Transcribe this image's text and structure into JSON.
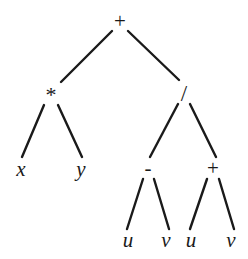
{
  "figure": {
    "type": "expression-tree",
    "background_color": "#ffffff",
    "stroke_color": "#1a1a1a",
    "text_color": "#1a1a1a",
    "width": 248,
    "height": 259
  },
  "nodes": {
    "root": {
      "label": "+",
      "x": 120,
      "y": 21,
      "kind": "operator"
    },
    "mul": {
      "label": "*",
      "x": 51,
      "y": 95,
      "kind": "operator"
    },
    "div": {
      "label": "/",
      "x": 184,
      "y": 93,
      "kind": "operator"
    },
    "x": {
      "label": "x",
      "x": 21,
      "y": 169,
      "kind": "variable"
    },
    "y": {
      "label": "y",
      "x": 81,
      "y": 169,
      "kind": "variable"
    },
    "sub": {
      "label": "-",
      "x": 148,
      "y": 168,
      "kind": "operator"
    },
    "add2": {
      "label": "+",
      "x": 213,
      "y": 168,
      "kind": "operator"
    },
    "u1": {
      "label": "u",
      "x": 128,
      "y": 240,
      "kind": "variable"
    },
    "v1": {
      "label": "v",
      "x": 166,
      "y": 240,
      "kind": "variable"
    },
    "u2": {
      "label": "u",
      "x": 191,
      "y": 240,
      "kind": "variable"
    },
    "v2": {
      "label": "v",
      "x": 231,
      "y": 240,
      "kind": "variable"
    }
  },
  "edges": [
    {
      "from": "root",
      "to": "mul",
      "x1": 112,
      "y1": 31,
      "x2": 61,
      "y2": 82
    },
    {
      "from": "root",
      "to": "div",
      "x1": 128,
      "y1": 31,
      "x2": 179,
      "y2": 80
    },
    {
      "from": "mul",
      "to": "x",
      "x1": 44,
      "y1": 105,
      "x2": 22,
      "y2": 157
    },
    {
      "from": "mul",
      "to": "y",
      "x1": 58,
      "y1": 105,
      "x2": 82,
      "y2": 157
    },
    {
      "from": "div",
      "to": "sub",
      "x1": 178,
      "y1": 104,
      "x2": 150,
      "y2": 157
    },
    {
      "from": "div",
      "to": "add2",
      "x1": 190,
      "y1": 104,
      "x2": 216,
      "y2": 157
    },
    {
      "from": "sub",
      "to": "u1",
      "x1": 143,
      "y1": 179,
      "x2": 127,
      "y2": 229
    },
    {
      "from": "sub",
      "to": "v1",
      "x1": 154,
      "y1": 179,
      "x2": 169,
      "y2": 229
    },
    {
      "from": "add2",
      "to": "u2",
      "x1": 207,
      "y1": 179,
      "x2": 190,
      "y2": 229
    },
    {
      "from": "add2",
      "to": "v2",
      "x1": 219,
      "y1": 179,
      "x2": 234,
      "y2": 229
    }
  ]
}
